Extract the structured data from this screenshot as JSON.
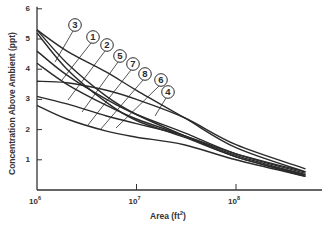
{
  "chart_data": {
    "type": "line",
    "title": "",
    "xlabel": "Area (ft2)",
    "xlabel_base": "Area (ft",
    "xlabel_sup": "2",
    "xlabel_end": ")",
    "ylabel": "Concentration Above Ambient (ppt)",
    "xscale": "log",
    "xlim": [
      1000000,
      700000000
    ],
    "ylim": [
      0,
      6
    ],
    "grid": false,
    "legend": "none (numbered callout circles on curves)",
    "x_ticks": [
      {
        "base": "10",
        "exp": "6",
        "value": 1000000
      },
      {
        "base": "10",
        "exp": "7",
        "value": 10000000
      },
      {
        "base": "10",
        "exp": "8",
        "value": 100000000
      }
    ],
    "y_ticks": [
      "1",
      "2",
      "3",
      "4",
      "5",
      "6"
    ],
    "series": [
      {
        "name": "1",
        "x": [
          1000000.0,
          2000000.0,
          5000000.0,
          10000000.0,
          30000000.0,
          100000000.0,
          500000000.0
        ],
        "values": [
          5.3,
          4.2,
          3.1,
          2.5,
          1.8,
          1.1,
          0.5
        ]
      },
      {
        "name": "2",
        "x": [
          1000000.0,
          2000000.0,
          5000000.0,
          10000000.0,
          30000000.0,
          100000000.0,
          500000000.0
        ],
        "values": [
          4.6,
          3.8,
          3.0,
          2.5,
          1.9,
          1.2,
          0.55
        ]
      },
      {
        "name": "3",
        "x": [
          1000000.0,
          2000000.0,
          5000000.0,
          10000000.0,
          30000000.0,
          100000000.0,
          500000000.0
        ],
        "values": [
          5.3,
          4.6,
          3.9,
          3.3,
          2.4,
          1.4,
          0.6
        ]
      },
      {
        "name": "4",
        "x": [
          1000000.0,
          2000000.0,
          5000000.0,
          10000000.0,
          30000000.0,
          100000000.0,
          500000000.0
        ],
        "values": [
          3.6,
          3.55,
          3.3,
          3.0,
          2.4,
          1.5,
          0.7
        ]
      },
      {
        "name": "5",
        "x": [
          1000000.0,
          2000000.0,
          5000000.0,
          10000000.0,
          30000000.0,
          100000000.0,
          500000000.0
        ],
        "values": [
          4.2,
          3.5,
          2.8,
          2.35,
          1.8,
          1.15,
          0.5
        ]
      },
      {
        "name": "6",
        "x": [
          1000000.0,
          2000000.0,
          5000000.0,
          10000000.0,
          30000000.0,
          100000000.0,
          500000000.0
        ],
        "values": [
          2.8,
          2.35,
          1.95,
          1.75,
          1.5,
          1.0,
          0.45
        ]
      },
      {
        "name": "7",
        "x": [
          1000000.0,
          2000000.0,
          5000000.0,
          10000000.0,
          30000000.0,
          100000000.0,
          500000000.0
        ],
        "values": [
          5.2,
          4.0,
          2.9,
          2.3,
          1.75,
          1.1,
          0.45
        ]
      },
      {
        "name": "8",
        "x": [
          1000000.0,
          2000000.0,
          5000000.0,
          10000000.0,
          30000000.0,
          100000000.0,
          500000000.0
        ],
        "values": [
          3.1,
          2.85,
          2.45,
          2.2,
          1.8,
          1.2,
          0.6
        ]
      }
    ],
    "callouts": [
      {
        "label": "3",
        "cx": 75,
        "cy": 25,
        "tx": 55,
        "ty": 62
      },
      {
        "label": "1",
        "cx": 93,
        "cy": 37,
        "tx": 62,
        "ty": 80
      },
      {
        "label": "2",
        "cx": 107,
        "cy": 45,
        "tx": 68,
        "ty": 100
      },
      {
        "label": "5",
        "cx": 120,
        "cy": 56,
        "tx": 82,
        "ty": 112
      },
      {
        "label": "7",
        "cx": 133,
        "cy": 64,
        "tx": 88,
        "ty": 125
      },
      {
        "label": "8",
        "cx": 145,
        "cy": 74,
        "tx": 100,
        "ty": 130
      },
      {
        "label": "6",
        "cx": 161,
        "cy": 80,
        "tx": 116,
        "ty": 128
      },
      {
        "label": "4",
        "cx": 168,
        "cy": 92,
        "tx": 155,
        "ty": 116
      }
    ]
  },
  "style": {
    "line_color": "#2a2a2a",
    "axis_color": "#333333",
    "background": "#ffffff"
  }
}
